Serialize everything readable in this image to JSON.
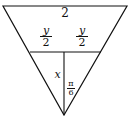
{
  "diagram": {
    "type": "geometry",
    "labels": {
      "top": "2",
      "half_left": {
        "num": "y",
        "den": "2"
      },
      "half_right": {
        "num": "y",
        "den": "2"
      },
      "altitude": "x",
      "angle": {
        "num": "π",
        "den": "6"
      }
    },
    "colors": {
      "line": "#111111",
      "background": "#ffffff"
    }
  }
}
